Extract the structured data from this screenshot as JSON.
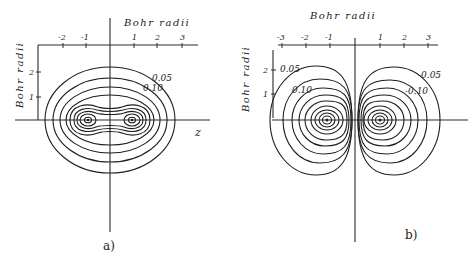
{
  "figure": {
    "panel_a": {
      "label": "a)",
      "top_axis_title": "Bohr radii",
      "side_axis_title": "Bohr radii",
      "horizontal_axis_label": "z",
      "x_ticks": [
        "-2",
        "-1",
        "1",
        "2",
        "3"
      ],
      "y_ticks": [
        "2",
        "1"
      ],
      "contour_labels": [
        "0.05",
        "0.10"
      ],
      "description": "Bonding orbital density contours, two nuclei enclosed by common contours"
    },
    "panel_b": {
      "label": "b)",
      "top_axis_title": "Bohr radii",
      "side_axis_title": "Bohr radii",
      "x_ticks": [
        "-3",
        "-2",
        "-1",
        "1",
        "2",
        "3"
      ],
      "y_ticks": [
        "2",
        "1"
      ],
      "contour_labels_left": [
        "0.05",
        "0.10"
      ],
      "contour_labels_right": [
        "-0.05",
        "-0.10"
      ],
      "description": "Antibonding orbital contours, two separate lobes with node at center"
    }
  }
}
